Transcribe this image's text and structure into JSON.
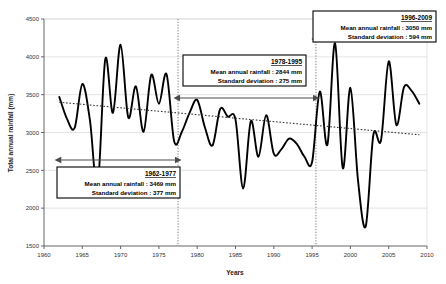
{
  "chart_data": {
    "type": "line",
    "title": "",
    "xlabel": "Years",
    "ylabel": "Total annual rainfall (mm)",
    "xlim": [
      1960,
      2010
    ],
    "ylim": [
      1500,
      4500
    ],
    "xticks": [
      1960,
      1965,
      1970,
      1975,
      1980,
      1985,
      1990,
      1995,
      2000,
      2005,
      2010
    ],
    "yticks": [
      1500,
      2000,
      2500,
      3000,
      3500,
      4000,
      4500
    ],
    "grid": true,
    "legend": "none",
    "series": [
      {
        "name": "Total annual rainfall",
        "style": "solid",
        "x": [
          1962,
          1963,
          1964,
          1965,
          1966,
          1967,
          1968,
          1969,
          1970,
          1971,
          1972,
          1973,
          1974,
          1975,
          1976,
          1977,
          1978,
          1979,
          1980,
          1981,
          1982,
          1983,
          1984,
          1985,
          1986,
          1987,
          1988,
          1989,
          1990,
          1991,
          1992,
          1993,
          1994,
          1995,
          1996,
          1997,
          1998,
          1999,
          2000,
          2001,
          2002,
          2003,
          2004,
          2005,
          2006,
          2007,
          2008,
          2009
        ],
        "values": [
          3470,
          3180,
          3060,
          3640,
          3160,
          2280,
          3970,
          3260,
          4160,
          3200,
          3610,
          3010,
          3760,
          3380,
          3770,
          2880,
          3010,
          3260,
          3430,
          3070,
          2830,
          3310,
          3210,
          3170,
          2260,
          3150,
          2680,
          3230,
          2720,
          2780,
          2920,
          2850,
          2680,
          2610,
          3540,
          2840,
          4180,
          2530,
          3590,
          2360,
          1760,
          2970,
          2900,
          3940,
          3100,
          3600,
          3550,
          3380
        ]
      },
      {
        "name": "Trend line",
        "style": "dotted",
        "x": [
          1962,
          2009
        ],
        "values": [
          3400,
          2970
        ]
      }
    ],
    "dividers": [
      1977.5,
      1995.5
    ],
    "periods": [
      {
        "id": "1962-1977",
        "label": "1962-1977",
        "mean_label": "Mean annual rainfall : 3469 mm",
        "sd_label": "Standard deviation : 377 mm",
        "mean": 3469,
        "sd": 377,
        "start": 1962,
        "end": 1977.5
      },
      {
        "id": "1978-1995",
        "label": "1978-1995",
        "mean_label": "Mean annual rainfall : 2844 mm",
        "sd_label": "Standard deviation : 275 mm",
        "mean": 2844,
        "sd": 275,
        "start": 1977.5,
        "end": 1995.5
      },
      {
        "id": "1996-2009",
        "label": "1996-2009",
        "mean_label": "Mean annual rainfall : 3050 mm",
        "sd_label": "Standard deviation : 594 mm",
        "mean": 3050,
        "sd": 594,
        "start": 1995.5,
        "end": 2009.5
      }
    ],
    "colors": {
      "series": "#000000",
      "trend": "#333333",
      "grid": "#d9d9d9",
      "axis": "#555555",
      "box_border": "#000000",
      "background": "#ffffff"
    }
  },
  "tick_text": {
    "x": [
      "1960",
      "1965",
      "1970",
      "1975",
      "1980",
      "1985",
      "1990",
      "1995",
      "2000",
      "2005",
      "2010"
    ],
    "y": [
      "1500",
      "2000",
      "2500",
      "3000",
      "3500",
      "4000",
      "4500"
    ]
  }
}
